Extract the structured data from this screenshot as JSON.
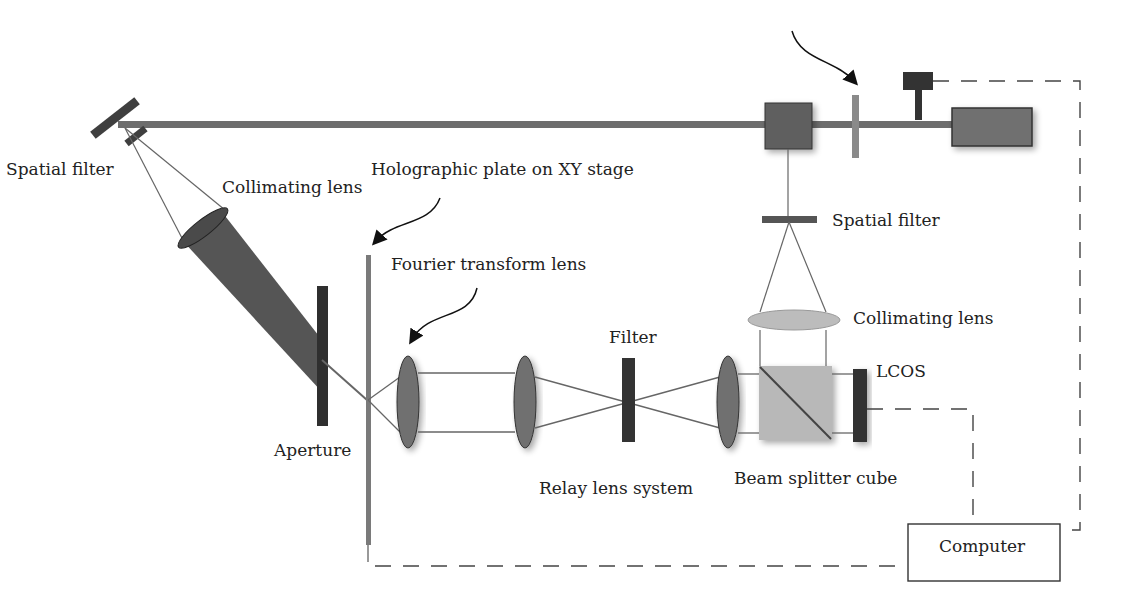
{
  "diagram": {
    "labels": {
      "spatial_filter_left": "Spatial filter",
      "collimating_lens_left": "Collimating lens",
      "holographic_plate": "Holographic plate on XY stage",
      "fourier_lens": "Fourier transform lens",
      "spatial_filter_right": "Spatial filter",
      "collimating_lens_right": "Collimating lens",
      "filter": "Filter",
      "lcos": "LCOS",
      "aperture": "Aperture",
      "relay_lens": "Relay lens system",
      "beam_splitter": "Beam splitter cube",
      "computer": "Computer"
    },
    "colors": {
      "beam": "#6a6a6a",
      "dark_component": "#3c3c3c",
      "lens": "#7a7a7a",
      "light_lens": "#bdbdbd",
      "cube": "#b8b8b8",
      "line": "#555555"
    }
  }
}
